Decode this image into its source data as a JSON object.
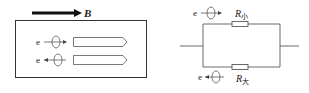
{
  "left_figure": {
    "field_label": "B",
    "electron_top_label": "e",
    "electron_bottom_label": "e",
    "electron_top_direction": "right",
    "electron_bottom_direction": "left"
  },
  "right_figure": {
    "electron_top_label": "e",
    "electron_bottom_label": "e",
    "electron_top_direction": "right",
    "electron_bottom_direction": "left",
    "resistor_top": {
      "symbol": "R",
      "subscript": "小"
    },
    "resistor_bottom": {
      "symbol": "R",
      "subscript": "大"
    }
  },
  "colors": {
    "line": "#333333",
    "arrow": "#111111",
    "text": "#222222"
  }
}
